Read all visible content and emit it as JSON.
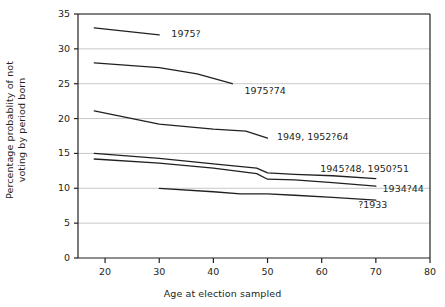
{
  "chart_data": {
    "type": "line",
    "title": "",
    "xlabel": "Age at election sampled",
    "ylabel": "Percentage probablity of not voting by period born",
    "xlim": [
      15,
      80
    ],
    "ylim": [
      0,
      35
    ],
    "xticks": [
      20,
      30,
      40,
      50,
      60,
      70,
      80
    ],
    "yticks": [
      0,
      5,
      10,
      15,
      20,
      25,
      30,
      35
    ],
    "grid": "horizontal",
    "legend": "inline-labels-at-line-ends",
    "series": [
      {
        "name": "1975?",
        "label": "1975?",
        "label_x": 31.5,
        "label_y": 32.1,
        "x": [
          18,
          30
        ],
        "y": [
          33.0,
          32.0
        ]
      },
      {
        "name": "1975?74",
        "label": "1975?74",
        "label_x": 45.0,
        "label_y": 24.0,
        "x": [
          18,
          30,
          37,
          43.5
        ],
        "y": [
          28.0,
          27.3,
          26.4,
          25.0
        ]
      },
      {
        "name": "1949, 1952?64",
        "label": "1949, 1952?64",
        "label_x": 51.0,
        "label_y": 17.3,
        "x": [
          18,
          30,
          40,
          46,
          50
        ],
        "y": [
          21.1,
          19.2,
          18.5,
          18.2,
          17.2
        ]
      },
      {
        "name": "1945?48, 1950?51",
        "label": "1945?48, 1950?51",
        "label_x": 59.0,
        "label_y": 12.8,
        "x": [
          18,
          30,
          40,
          48,
          50,
          55,
          62,
          70
        ],
        "y": [
          15.0,
          14.3,
          13.5,
          12.9,
          12.2,
          12.0,
          11.8,
          11.4
        ]
      },
      {
        "name": "1934?44",
        "label": "1934?44",
        "label_x": 70.5,
        "label_y": 9.9,
        "x": [
          18,
          30,
          40,
          48,
          50,
          55,
          62,
          70
        ],
        "y": [
          14.2,
          13.6,
          12.9,
          12.1,
          11.3,
          11.2,
          10.8,
          10.3
        ]
      },
      {
        "name": "?1933",
        "label": "?1933",
        "label_x": 66.0,
        "label_y": 7.6,
        "x": [
          30,
          40,
          45,
          50,
          55,
          62,
          70
        ],
        "y": [
          10.0,
          9.5,
          9.2,
          9.2,
          9.0,
          8.7,
          8.3
        ]
      }
    ]
  },
  "colors": {
    "line": "#231f20",
    "grid": "#c9c9c9",
    "axis": "#231f20",
    "background": "#ffffff"
  }
}
